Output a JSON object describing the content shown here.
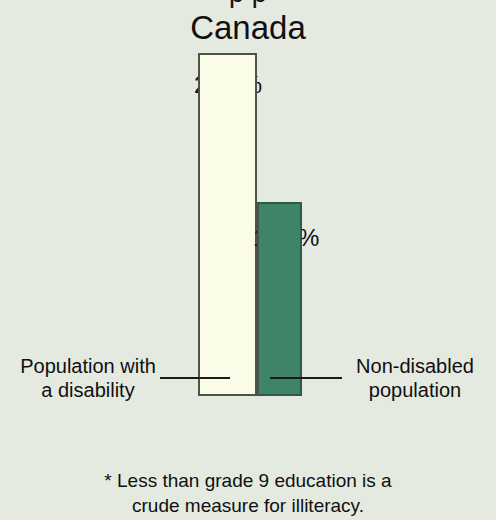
{
  "chart_data": {
    "type": "bar",
    "title": "Canada",
    "supertitle_clipped": "p p",
    "categories": [
      "Population with a disability",
      "Non-disabled population"
    ],
    "values": [
      23.8,
      11.3
    ],
    "value_labels": [
      "23.8%",
      "11.3%"
    ],
    "xlabel": "",
    "ylabel": "",
    "ylim": [
      0,
      26
    ],
    "grid": false,
    "legend_position": "none",
    "series": [
      {
        "name": "Less than grade 9 education",
        "values": [
          23.8,
          11.3
        ]
      }
    ],
    "bar_colors": [
      "#fbfce8",
      "#3f8468"
    ],
    "bar_border_colors": [
      "#4a5448",
      "#2c5b48"
    ],
    "background_color": "#e4eae0",
    "annotations": [
      {
        "name": "callout-left",
        "line1": "Population with",
        "line2": "a disability"
      },
      {
        "name": "callout-right",
        "line1": "Non-disabled",
        "line2": "population"
      }
    ],
    "footnote": {
      "line1": "* Less than grade 9 education is a",
      "line2": "crude measure for illiteracy."
    }
  }
}
